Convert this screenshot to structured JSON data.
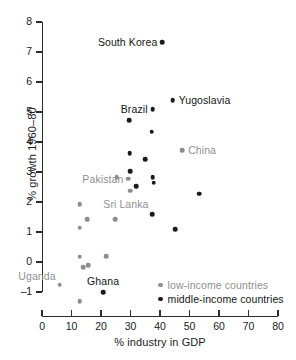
{
  "chart_data": {
    "type": "scatter",
    "title": "",
    "xlabel": "% industry in GDP",
    "ylabel": "% growth 1960–80",
    "xlim": [
      0,
      80
    ],
    "ylim": [
      -1,
      8
    ],
    "xticks": [
      0,
      10,
      20,
      30,
      40,
      50,
      60,
      70,
      80
    ],
    "yticks": [
      -1,
      0,
      1,
      2,
      3,
      4,
      5,
      6,
      7,
      8
    ],
    "xtick_labels": [
      "0",
      "10",
      "20",
      "30",
      "40",
      "50",
      "60",
      "70",
      "80"
    ],
    "ytick_labels": [
      "-1",
      "0",
      "1",
      "2",
      "3",
      "4",
      "5",
      "6",
      "7",
      "8"
    ],
    "grid": false,
    "legend_position": "bottom-right",
    "series": [
      {
        "name": "low-income countries",
        "color": "#8d8d8d",
        "points": [
          {
            "x": 6.0,
            "y": -0.75,
            "label": "Uganda",
            "label_anchor": "right",
            "label_dx": -4,
            "label_dy": -9
          },
          {
            "x": 12.8,
            "y": 1.92,
            "label": ""
          },
          {
            "x": 12.8,
            "y": 1.15,
            "label": ""
          },
          {
            "x": 12.8,
            "y": 0.18,
            "label": ""
          },
          {
            "x": 12.8,
            "y": -1.3,
            "label": ""
          },
          {
            "x": 14.0,
            "y": -0.18,
            "label": ""
          },
          {
            "x": 15.3,
            "y": 1.42,
            "label": ""
          },
          {
            "x": 15.6,
            "y": -0.1,
            "label": ""
          },
          {
            "x": 21.8,
            "y": 0.2,
            "label": ""
          },
          {
            "x": 24.8,
            "y": 1.43,
            "label": ""
          },
          {
            "x": 29.3,
            "y": 2.78,
            "label": "Pakistan",
            "label_anchor": "right",
            "label_dx": -5,
            "label_dy": 0
          },
          {
            "x": 25.3,
            "y": 2.82,
            "label": ""
          },
          {
            "x": 29.8,
            "y": 2.38,
            "label": "Sri Lanka",
            "label_anchor": "center",
            "label_dx": -4,
            "label_dy": 13
          },
          {
            "x": 47.5,
            "y": 3.72,
            "label": "China",
            "label_anchor": "left",
            "label_dx": 6,
            "label_dy": 0
          }
        ]
      },
      {
        "name": "middle-income countries",
        "color": "#1b1b1b",
        "points": [
          {
            "x": 40.8,
            "y": 7.32,
            "label": "South Korea",
            "label_anchor": "right",
            "label_dx": -5,
            "label_dy": 0
          },
          {
            "x": 44.3,
            "y": 5.4,
            "label": "Yugoslavia",
            "label_anchor": "left",
            "label_dx": 6,
            "label_dy": 0
          },
          {
            "x": 37.5,
            "y": 5.1,
            "label": "Brazil",
            "label_anchor": "right",
            "label_dx": -5,
            "label_dy": 0
          },
          {
            "x": 29.5,
            "y": 4.73,
            "label": ""
          },
          {
            "x": 37.2,
            "y": 4.34,
            "label": ""
          },
          {
            "x": 29.7,
            "y": 3.62,
            "label": ""
          },
          {
            "x": 35.0,
            "y": 3.43,
            "label": ""
          },
          {
            "x": 29.8,
            "y": 3.03,
            "label": ""
          },
          {
            "x": 37.5,
            "y": 2.83,
            "label": ""
          },
          {
            "x": 32.0,
            "y": 2.53,
            "label": ""
          },
          {
            "x": 37.8,
            "y": 2.64,
            "label": ""
          },
          {
            "x": 53.2,
            "y": 2.28,
            "label": ""
          },
          {
            "x": 37.3,
            "y": 1.6,
            "label": ""
          },
          {
            "x": 45.2,
            "y": 1.1,
            "label": ""
          },
          {
            "x": 20.7,
            "y": -1.0,
            "label": "Ghana",
            "label_anchor": "center",
            "label_dx": 0,
            "label_dy": -11
          }
        ]
      }
    ]
  },
  "legend": {
    "items": [
      {
        "label": "low-income countries",
        "group": "low"
      },
      {
        "label": "middle-income countries",
        "group": "middle"
      }
    ]
  }
}
